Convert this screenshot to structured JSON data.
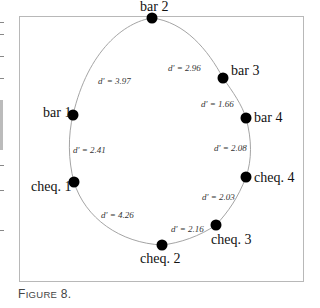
{
  "figure": {
    "caption_first": "F",
    "caption_rest": "IGURE",
    "caption_number": " 8."
  },
  "diagram": {
    "nodes": [
      {
        "id": "bar2",
        "label": "bar 2"
      },
      {
        "id": "bar3",
        "label": "bar 3"
      },
      {
        "id": "bar4",
        "label": "bar 4"
      },
      {
        "id": "cheq4",
        "label": "cheq. 4"
      },
      {
        "id": "cheq3",
        "label": "cheq. 3"
      },
      {
        "id": "cheq2",
        "label": "cheq. 2"
      },
      {
        "id": "cheq1",
        "label": "cheq. 1"
      },
      {
        "id": "bar1",
        "label": "bar 1"
      }
    ],
    "edges": [
      {
        "from": "bar1",
        "to": "bar2",
        "label": "d' = 3.97"
      },
      {
        "from": "bar2",
        "to": "bar3",
        "label": "d' = 2.96"
      },
      {
        "from": "bar3",
        "to": "bar4",
        "label": "d' = 1.66"
      },
      {
        "from": "bar4",
        "to": "cheq4",
        "label": "d' = 2.08"
      },
      {
        "from": "cheq4",
        "to": "cheq3",
        "label": "d' = 2.03"
      },
      {
        "from": "cheq3",
        "to": "cheq2",
        "label": "d' = 2.16"
      },
      {
        "from": "cheq2",
        "to": "cheq1",
        "label": "d' = 4.26"
      },
      {
        "from": "cheq1",
        "to": "bar1",
        "label": "d' = 2.41"
      }
    ]
  }
}
